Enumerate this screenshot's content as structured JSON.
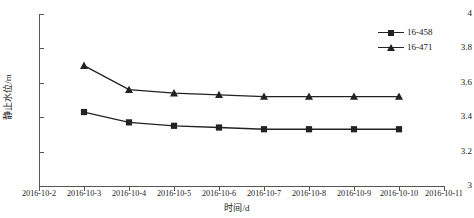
{
  "chart_data": {
    "type": "line",
    "title": "",
    "xlabel": "时间/d",
    "ylabel": "静止水位/m",
    "x": [
      "2016-10-2",
      "2016-10-3",
      "2016-10-4",
      "2016-10-5",
      "2016-10-6",
      "2016-10-7",
      "2016-10-8",
      "2016-10-9",
      "2016-10-10",
      "2016-10-11"
    ],
    "xtick_labels": [
      "2016-10-2",
      "2016-10-3",
      "2016-10-4",
      "2016-10-5",
      "2016-10-6",
      "2016-10-7",
      "2016-10-8",
      "2016-10-9",
      "2016-10-10",
      "2016-10-11"
    ],
    "ytick_labels": [
      "3",
      "3.2",
      "3.4",
      "3.6",
      "3.8",
      "4"
    ],
    "ytick_values": [
      3,
      3.2,
      3.4,
      3.6,
      3.8,
      4
    ],
    "ylim": [
      3,
      4
    ],
    "grid": false,
    "legend_position": "top-right",
    "series": [
      {
        "name": "16-458",
        "marker": "square",
        "color": "#222222",
        "x": [
          "2016-10-3",
          "2016-10-4",
          "2016-10-5",
          "2016-10-6",
          "2016-10-7",
          "2016-10-8",
          "2016-10-9",
          "2016-10-10"
        ],
        "values": [
          3.43,
          3.37,
          3.35,
          3.34,
          3.33,
          3.33,
          3.33,
          3.33
        ]
      },
      {
        "name": "16-471",
        "marker": "triangle",
        "color": "#222222",
        "x": [
          "2016-10-3",
          "2016-10-4",
          "2016-10-5",
          "2016-10-6",
          "2016-10-7",
          "2016-10-8",
          "2016-10-9",
          "2016-10-10"
        ],
        "values": [
          3.7,
          3.56,
          3.54,
          3.53,
          3.52,
          3.52,
          3.52,
          3.52
        ]
      }
    ]
  },
  "legend": {
    "items": [
      {
        "label": "16-458"
      },
      {
        "label": "16-471"
      }
    ]
  },
  "axes": {
    "y_title": "静止水位/m",
    "x_title": "时间/d"
  }
}
